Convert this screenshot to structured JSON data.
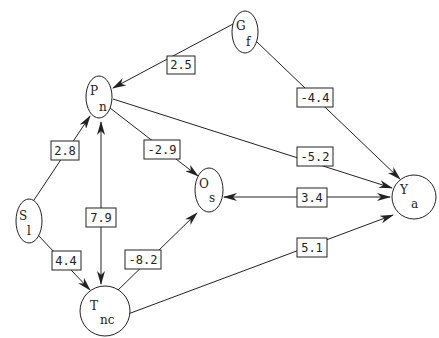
{
  "nodes": {
    "G": {
      "main": "G",
      "sub": "f"
    },
    "P": {
      "main": "P",
      "sub": "n"
    },
    "S": {
      "main": "S",
      "sub": "l"
    },
    "O": {
      "main": "O",
      "sub": "s"
    },
    "Y": {
      "main": "Y",
      "sub": "a"
    },
    "T": {
      "main": "T",
      "sub": "nc"
    }
  },
  "edges": {
    "G_P": {
      "from": "G",
      "to": "P",
      "weight": "2.5",
      "direction": "forward"
    },
    "G_Y": {
      "from": "G",
      "to": "Y",
      "weight": "-4.4",
      "direction": "forward"
    },
    "P_O": {
      "from": "P",
      "to": "O",
      "weight": "-2.9",
      "direction": "forward"
    },
    "P_Y": {
      "from": "P",
      "to": "Y",
      "weight": "-5.2",
      "direction": "forward"
    },
    "S_P": {
      "from": "S",
      "to": "P",
      "weight": "2.8",
      "direction": "forward"
    },
    "P_T": {
      "from": "P",
      "to": "T",
      "weight": "7.9",
      "direction": "bidirectional"
    },
    "S_T": {
      "from": "S",
      "to": "T",
      "weight": "4.4",
      "direction": "forward"
    },
    "T_O": {
      "from": "T",
      "to": "O",
      "weight": "-8.2",
      "direction": "forward"
    },
    "O_Y": {
      "from": "O",
      "to": "Y",
      "weight": "3.4",
      "direction": "bidirectional"
    },
    "T_Y": {
      "from": "T",
      "to": "Y",
      "weight": "5.1",
      "direction": "forward"
    }
  },
  "colors": {
    "stroke": "#222222",
    "background": "#ffffff"
  }
}
